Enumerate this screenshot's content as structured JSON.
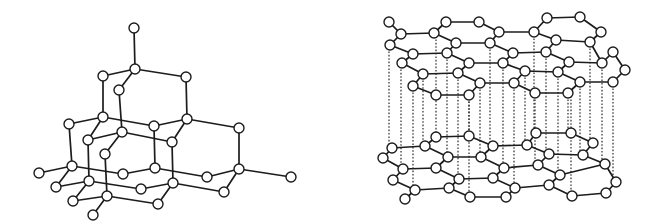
{
  "figure": {
    "background": "#ffffff",
    "ink": "#1c1c1c",
    "atom_radius": 5
  },
  "diamond": {
    "label": "diamond-structure",
    "atoms": {
      "top": [
        134,
        28
      ],
      "A": [
        135,
        69
      ],
      "B": [
        103,
        76
      ],
      "C": [
        186,
        77
      ],
      "D": [
        119,
        90
      ],
      "E": [
        103,
        117
      ],
      "F": [
        187,
        119
      ],
      "G": [
        69,
        124
      ],
      "H": [
        154,
        126
      ],
      "I": [
        239,
        128
      ],
      "J": [
        122,
        132
      ],
      "K": [
        88,
        140
      ],
      "L": [
        172,
        142
      ],
      "M": [
        105,
        154
      ],
      "N": [
        72,
        166
      ],
      "O": [
        155,
        168
      ],
      "P": [
        239,
        169
      ],
      "Q": [
        39,
        173
      ],
      "R": [
        123,
        174
      ],
      "S": [
        207,
        177
      ],
      "T": [
        291,
        177
      ],
      "U": [
        89,
        181
      ],
      "V": [
        173,
        183
      ],
      "W": [
        56,
        187
      ],
      "X": [
        141,
        189
      ],
      "Y": [
        224,
        192
      ],
      "Z": [
        107,
        196
      ],
      "AA": [
        73,
        201
      ],
      "AB": [
        158,
        204
      ],
      "AC": [
        93,
        215
      ]
    },
    "bonds": [
      [
        "top",
        "A"
      ],
      [
        "A",
        "B"
      ],
      [
        "A",
        "C"
      ],
      [
        "A",
        "D"
      ],
      [
        "B",
        "E"
      ],
      [
        "C",
        "F"
      ],
      [
        "D",
        "J"
      ],
      [
        "E",
        "G"
      ],
      [
        "E",
        "H"
      ],
      [
        "E",
        "K"
      ],
      [
        "F",
        "H"
      ],
      [
        "F",
        "I"
      ],
      [
        "F",
        "L"
      ],
      [
        "J",
        "K"
      ],
      [
        "J",
        "L"
      ],
      [
        "J",
        "M"
      ],
      [
        "G",
        "N"
      ],
      [
        "H",
        "O"
      ],
      [
        "I",
        "P"
      ],
      [
        "K",
        "U"
      ],
      [
        "L",
        "V"
      ],
      [
        "M",
        "Z"
      ],
      [
        "N",
        "Q"
      ],
      [
        "N",
        "R"
      ],
      [
        "N",
        "W"
      ],
      [
        "O",
        "R"
      ],
      [
        "O",
        "S"
      ],
      [
        "P",
        "S"
      ],
      [
        "P",
        "T"
      ],
      [
        "P",
        "Y"
      ],
      [
        "U",
        "W"
      ],
      [
        "U",
        "X"
      ],
      [
        "U",
        "AA"
      ],
      [
        "V",
        "X"
      ],
      [
        "V",
        "Y"
      ],
      [
        "V",
        "AB"
      ],
      [
        "Z",
        "AA"
      ],
      [
        "Z",
        "AB"
      ],
      [
        "Z",
        "AC"
      ]
    ]
  },
  "graphite": {
    "label": "graphite-structure",
    "atoms": {
      "t1": [
        389,
        22
      ],
      "t2": [
        401,
        34
      ],
      "t3": [
        390,
        45
      ],
      "t4": [
        446,
        22
      ],
      "t5": [
        479,
        22
      ],
      "t6": [
        434,
        33
      ],
      "t7": [
        456,
        43
      ],
      "t8": [
        490,
        43
      ],
      "t9": [
        499,
        32
      ],
      "t10": [
        547,
        18
      ],
      "t11": [
        580,
        17
      ],
      "t12": [
        601,
        32
      ],
      "t13": [
        534,
        32
      ],
      "t14": [
        556,
        40
      ],
      "t15": [
        590,
        42
      ],
      "t16": [
        613,
        52
      ],
      "t17": [
        413,
        54
      ],
      "t18": [
        447,
        53
      ],
      "t19": [
        402,
        63
      ],
      "t20": [
        469,
        63
      ],
      "t21": [
        503,
        63
      ],
      "t22": [
        513,
        53
      ],
      "t23": [
        546,
        52
      ],
      "t24": [
        569,
        62
      ],
      "t25": [
        602,
        63
      ],
      "t26": [
        625,
        70
      ],
      "t27": [
        423,
        74
      ],
      "t28": [
        458,
        73
      ],
      "t29": [
        413,
        86
      ],
      "t30": [
        480,
        83
      ],
      "t31": [
        514,
        83
      ],
      "t32": [
        525,
        71
      ],
      "t33": [
        558,
        72
      ],
      "t34": [
        580,
        82
      ],
      "t35": [
        613,
        82
      ],
      "t36": [
        436,
        95
      ],
      "t37": [
        469,
        95
      ],
      "t38": [
        535,
        93
      ],
      "t39": [
        568,
        93
      ],
      "b1": [
        436,
        137
      ],
      "b2": [
        469,
        136
      ],
      "b3": [
        536,
        133
      ],
      "b4": [
        571,
        133
      ],
      "b5": [
        593,
        143
      ],
      "b6": [
        392,
        148
      ],
      "b7": [
        425,
        146
      ],
      "b8": [
        493,
        146
      ],
      "b9": [
        527,
        145
      ],
      "b10": [
        549,
        154
      ],
      "b11": [
        583,
        155
      ],
      "b12": [
        383,
        158
      ],
      "b13": [
        403,
        169
      ],
      "b14": [
        436,
        168
      ],
      "b15": [
        448,
        157
      ],
      "b16": [
        481,
        157
      ],
      "b17": [
        504,
        168
      ],
      "b18": [
        538,
        165
      ],
      "b19": [
        560,
        175
      ],
      "b20": [
        605,
        164
      ],
      "b21": [
        393,
        180
      ],
      "b22": [
        415,
        190
      ],
      "b23": [
        449,
        188
      ],
      "b24": [
        459,
        179
      ],
      "b25": [
        493,
        178
      ],
      "b26": [
        515,
        188
      ],
      "b27": [
        549,
        185
      ],
      "b28": [
        572,
        196
      ],
      "b29": [
        606,
        193
      ],
      "b30": [
        616,
        182
      ],
      "b31": [
        405,
        199
      ],
      "b32": [
        470,
        197
      ],
      "b33": [
        506,
        197
      ]
    },
    "bonds": [
      [
        "t1",
        "t2"
      ],
      [
        "t2",
        "t3"
      ],
      [
        "t2",
        "t6"
      ],
      [
        "t6",
        "t4"
      ],
      [
        "t4",
        "t5"
      ],
      [
        "t5",
        "t9"
      ],
      [
        "t6",
        "t7"
      ],
      [
        "t7",
        "t8"
      ],
      [
        "t8",
        "t9"
      ],
      [
        "t9",
        "t13"
      ],
      [
        "t13",
        "t10"
      ],
      [
        "t10",
        "t11"
      ],
      [
        "t11",
        "t12"
      ],
      [
        "t12",
        "t15"
      ],
      [
        "t13",
        "t14"
      ],
      [
        "t14",
        "t15"
      ],
      [
        "t3",
        "t17"
      ],
      [
        "t17",
        "t18"
      ],
      [
        "t18",
        "t7"
      ],
      [
        "t17",
        "t19"
      ],
      [
        "t18",
        "t20"
      ],
      [
        "t20",
        "t21"
      ],
      [
        "t21",
        "t22"
      ],
      [
        "t22",
        "t8"
      ],
      [
        "t22",
        "t23"
      ],
      [
        "t23",
        "t14"
      ],
      [
        "t23",
        "t24"
      ],
      [
        "t24",
        "t25"
      ],
      [
        "t25",
        "t15"
      ],
      [
        "t25",
        "t16"
      ],
      [
        "t16",
        "t26"
      ],
      [
        "t19",
        "t27"
      ],
      [
        "t27",
        "t28"
      ],
      [
        "t28",
        "t20"
      ],
      [
        "t27",
        "t29"
      ],
      [
        "t28",
        "t30"
      ],
      [
        "t30",
        "t31"
      ],
      [
        "t31",
        "t32"
      ],
      [
        "t32",
        "t21"
      ],
      [
        "t32",
        "t33"
      ],
      [
        "t33",
        "t24"
      ],
      [
        "t33",
        "t34"
      ],
      [
        "t34",
        "t35"
      ],
      [
        "t35",
        "t26"
      ],
      [
        "t29",
        "t36"
      ],
      [
        "t36",
        "t37"
      ],
      [
        "t37",
        "t30"
      ],
      [
        "t31",
        "t38"
      ],
      [
        "t38",
        "t39"
      ],
      [
        "t39",
        "t34"
      ],
      [
        "b1",
        "b2"
      ],
      [
        "b2",
        "b8"
      ],
      [
        "b3",
        "b4"
      ],
      [
        "b4",
        "b5"
      ],
      [
        "b8",
        "b9"
      ],
      [
        "b9",
        "b3"
      ],
      [
        "b5",
        "b11"
      ],
      [
        "b6",
        "b7"
      ],
      [
        "b7",
        "b1"
      ],
      [
        "b6",
        "b12"
      ],
      [
        "b7",
        "b15"
      ],
      [
        "b15",
        "b16"
      ],
      [
        "b16",
        "b8"
      ],
      [
        "b9",
        "b10"
      ],
      [
        "b10",
        "b11"
      ],
      [
        "b10",
        "b18"
      ],
      [
        "b11",
        "b20"
      ],
      [
        "b12",
        "b13"
      ],
      [
        "b13",
        "b14"
      ],
      [
        "b14",
        "b15"
      ],
      [
        "b16",
        "b17"
      ],
      [
        "b17",
        "b18"
      ],
      [
        "b18",
        "b19"
      ],
      [
        "b19",
        "b20"
      ],
      [
        "b13",
        "b21"
      ],
      [
        "b21",
        "b22"
      ],
      [
        "b22",
        "b23"
      ],
      [
        "b23",
        "b24"
      ],
      [
        "b24",
        "b14"
      ],
      [
        "b24",
        "b25"
      ],
      [
        "b25",
        "b17"
      ],
      [
        "b25",
        "b26"
      ],
      [
        "b26",
        "b27"
      ],
      [
        "b27",
        "b19"
      ],
      [
        "b27",
        "b28"
      ],
      [
        "b28",
        "b29"
      ],
      [
        "b29",
        "b30"
      ],
      [
        "b30",
        "b20"
      ],
      [
        "b22",
        "b31"
      ],
      [
        "b23",
        "b32"
      ],
      [
        "b32",
        "b33"
      ],
      [
        "b33",
        "b26"
      ]
    ],
    "interlayer_links": [
      [
        389,
        48,
        389,
        148
      ],
      [
        401,
        66,
        401,
        168
      ],
      [
        413,
        89,
        413,
        190
      ],
      [
        423,
        77,
        423,
        146
      ],
      [
        436,
        36,
        436,
        137
      ],
      [
        447,
        56,
        447,
        157
      ],
      [
        458,
        76,
        458,
        179
      ],
      [
        469,
        98,
        469,
        136
      ],
      [
        490,
        46,
        490,
        146
      ],
      [
        503,
        66,
        503,
        168
      ],
      [
        514,
        86,
        514,
        188
      ],
      [
        525,
        74,
        525,
        145
      ],
      [
        534,
        35,
        534,
        133
      ],
      [
        546,
        55,
        546,
        154
      ],
      [
        558,
        75,
        558,
        175
      ],
      [
        568,
        96,
        568,
        133
      ],
      [
        580,
        85,
        580,
        155
      ],
      [
        590,
        45,
        590,
        143
      ],
      [
        602,
        66,
        602,
        164
      ],
      [
        613,
        85,
        613,
        182
      ],
      [
        480,
        86,
        480,
        157
      ],
      [
        535,
        96,
        535,
        165
      ],
      [
        571,
        96,
        571,
        196
      ],
      [
        469,
        98,
        469,
        197
      ]
    ]
  }
}
